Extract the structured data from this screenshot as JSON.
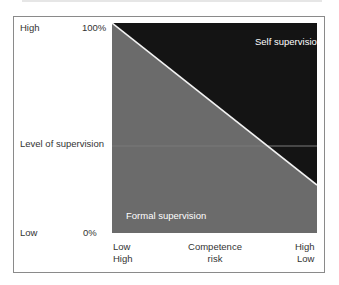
{
  "diagram": {
    "y_axis": {
      "title": "Level of supervision",
      "top_label": "High",
      "bottom_label": "Low",
      "top_percent": "100%",
      "bottom_percent": "0%"
    },
    "x_axis": {
      "title_line1": "Competence",
      "title_line2": "risk",
      "left_line1": "Low",
      "left_line2": "High",
      "right_line1": "High",
      "right_line2": "Low"
    },
    "regions": {
      "upper": {
        "label": "Self supervision",
        "color": "#141414"
      },
      "lower": {
        "label": "Formal supervision",
        "color": "#6b6b6b"
      }
    },
    "divider_color": "#f2f2f2",
    "divider": {
      "from": [
        0,
        100
      ],
      "to": [
        100,
        23
      ]
    }
  }
}
